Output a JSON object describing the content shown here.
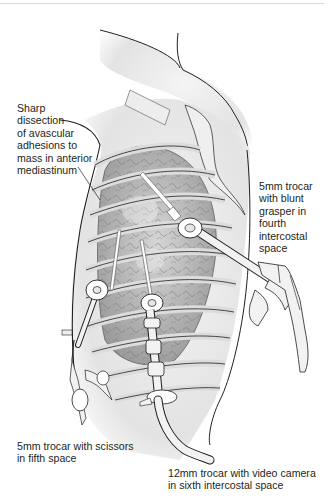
{
  "figure": {
    "type": "surgical-illustration",
    "colors": {
      "background": "#ffffff",
      "outline": "#231f20",
      "skin_shade": "#e6e6e6",
      "rib_fill": "#dcdcdc",
      "lung_fill": "#a9a9a9",
      "instrument_fill": "#f2f2f2"
    }
  },
  "annotations": [
    {
      "id": "sharp-dissection",
      "text": "Sharp\ndissection\nof avascular\nadhesions to\nmass in anterior\nmediastinum"
    },
    {
      "id": "blunt-grasper-port",
      "text": "5mm trocar\nwith blunt\ngrasper in\nfourth\nintercostal\nspace"
    },
    {
      "id": "scissors-port",
      "text": "5mm trocar with scissors\nin fifth space"
    },
    {
      "id": "camera-port",
      "text": "12mm trocar with video camera\nin sixth intercostal space"
    }
  ],
  "instruments": [
    {
      "name": "blunt-grasper",
      "port_size": "5mm",
      "location": "fourth intercostal space"
    },
    {
      "name": "scissors",
      "port_size": "5mm",
      "location": "fifth space"
    },
    {
      "name": "video-camera",
      "port_size": "12mm",
      "location": "sixth intercostal space"
    }
  ]
}
